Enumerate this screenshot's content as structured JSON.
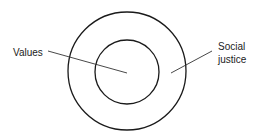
{
  "diagram": {
    "type": "concentric-circles",
    "stroke_color": "#1a1a1a",
    "background": "#ffffff",
    "labels": {
      "inner": "Values",
      "outer_line1": "Social",
      "outer_line2": "justice"
    },
    "circles": [
      {
        "name": "outer",
        "label": "Social justice"
      },
      {
        "name": "inner",
        "label": "Values"
      }
    ]
  }
}
